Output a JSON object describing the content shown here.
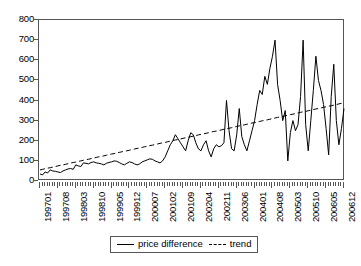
{
  "chart_data": {
    "type": "line",
    "title": "",
    "xlabel": "",
    "ylabel": "",
    "ylim": [
      0,
      800
    ],
    "yticks": [
      0,
      100,
      200,
      300,
      400,
      500,
      600,
      700,
      800
    ],
    "grid": false,
    "legend_position": "bottom-center",
    "x_tick_labels": [
      "199701",
      "199708",
      "199803",
      "199810",
      "199905",
      "199912",
      "200007",
      "200102",
      "200109",
      "200204",
      "200211",
      "200306",
      "200401",
      "200408",
      "200503",
      "200510",
      "200605",
      "200612"
    ],
    "x_tick_step_months": 7,
    "x_start": "199701",
    "x_end": "200612",
    "n_points": 120,
    "series": [
      {
        "name": "price difference",
        "style": "solid",
        "color": "#000000",
        "values": [
          35,
          30,
          45,
          40,
          55,
          50,
          48,
          45,
          42,
          50,
          55,
          60,
          62,
          58,
          80,
          75,
          72,
          90,
          88,
          85,
          92,
          95,
          90,
          88,
          85,
          80,
          88,
          92,
          95,
          100,
          98,
          92,
          85,
          80,
          88,
          95,
          92,
          85,
          80,
          85,
          95,
          100,
          105,
          110,
          108,
          100,
          95,
          90,
          100,
          120,
          150,
          180,
          200,
          230,
          210,
          190,
          170,
          150,
          200,
          240,
          230,
          190,
          160,
          150,
          180,
          200,
          150,
          120,
          160,
          180,
          170,
          175,
          190,
          400,
          250,
          160,
          150,
          230,
          360,
          220,
          180,
          150,
          200,
          250,
          300,
          380,
          450,
          430,
          520,
          480,
          560,
          620,
          700,
          480,
          400,
          300,
          350,
          100,
          240,
          300,
          250,
          280,
          420,
          700,
          280,
          150,
          300,
          450,
          620,
          500,
          450,
          380,
          260,
          130,
          420,
          580,
          300,
          180,
          260,
          360
        ]
      },
      {
        "name": "trend",
        "style": "dashed",
        "color": "#000000",
        "values": [
          55,
          58,
          61,
          64,
          66,
          69,
          72,
          75,
          78,
          80,
          83,
          86,
          89,
          92,
          94,
          97,
          100,
          103,
          106,
          108,
          111,
          114,
          117,
          120,
          122,
          125,
          128,
          131,
          134,
          136,
          139,
          142,
          145,
          148,
          150,
          153,
          156,
          159,
          162,
          164,
          167,
          170,
          173,
          176,
          178,
          181,
          184,
          187,
          190,
          192,
          195,
          198,
          201,
          204,
          206,
          209,
          212,
          215,
          218,
          220,
          223,
          226,
          229,
          232,
          234,
          237,
          240,
          243,
          246,
          248,
          251,
          254,
          257,
          260,
          262,
          265,
          268,
          271,
          274,
          276,
          279,
          282,
          285,
          288,
          290,
          293,
          296,
          299,
          302,
          304,
          307,
          310,
          313,
          316,
          318,
          321,
          324,
          327,
          330,
          332,
          335,
          338,
          341,
          344,
          346,
          349,
          352,
          355,
          358,
          360,
          363,
          366,
          369,
          372,
          374,
          377,
          380,
          383,
          386,
          388
        ]
      }
    ]
  },
  "legend": {
    "items": [
      {
        "label": "price difference",
        "style": "solid"
      },
      {
        "label": "trend",
        "style": "dashed"
      }
    ]
  }
}
